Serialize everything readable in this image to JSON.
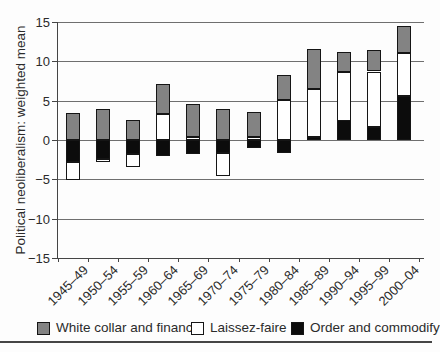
{
  "chart_data": {
    "type": "bar",
    "stacked": true,
    "title": "",
    "xlabel": "",
    "ylabel": "Political neoliberalism: weighted mean",
    "ylim": [
      -15,
      15
    ],
    "yticks": [
      15,
      10,
      5,
      0,
      -5,
      -10,
      -15
    ],
    "grid": true,
    "legend_position": "bottom",
    "categories": [
      "1945–49",
      "1950–54",
      "1955–59",
      "1960–64",
      "1965–69",
      "1970–74",
      "1975–79",
      "1980–84",
      "1985–89",
      "1990–94",
      "1995–99",
      "2000–04"
    ],
    "series": [
      {
        "name": "Order and commodify",
        "color": "#0c0c0c",
        "values": [
          -2.8,
          -2.4,
          -1.8,
          -2.0,
          -1.8,
          -1.6,
          -1.0,
          -1.6,
          0.4,
          2.5,
          1.7,
          5.6
        ]
      },
      {
        "name": "Laissez-faire",
        "color": "#ffffff",
        "values": [
          -2.3,
          -0.4,
          -1.7,
          3.3,
          0.4,
          -2.9,
          0.4,
          5.1,
          6.1,
          6.2,
          7.0,
          5.5
        ]
      },
      {
        "name": "White collar and finance",
        "color": "#838383",
        "values": [
          3.4,
          4.0,
          2.5,
          3.8,
          4.2,
          4.0,
          3.2,
          3.2,
          5.1,
          2.5,
          2.7,
          3.4
        ]
      }
    ]
  },
  "legend": {
    "items": [
      {
        "label": "White collar and finance",
        "color": "#838383"
      },
      {
        "label": "Laissez-faire",
        "color": "#ffffff"
      },
      {
        "label": "Order and commodify",
        "color": "#0c0c0c"
      }
    ]
  }
}
